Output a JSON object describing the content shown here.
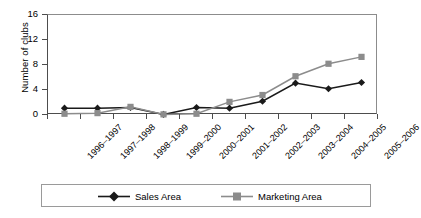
{
  "chart_data": {
    "type": "line",
    "title": "",
    "xlabel": "",
    "ylabel": "Number of clubs",
    "ylim": [
      0,
      16
    ],
    "yticks": [
      0,
      4,
      8,
      12,
      16
    ],
    "grid": false,
    "legend_position": "bottom",
    "categories": [
      "1996–1997",
      "1997–1998",
      "1998–1999",
      "1999–2000",
      "2000–2001",
      "2001–2002",
      "2002–2003",
      "2003–2004",
      "2004–2005",
      "2005–2006"
    ],
    "series": [
      {
        "name": "Sales Area",
        "color": "#1a1a1a",
        "marker": "diamond",
        "values": [
          1.1,
          1.1,
          1.2,
          0.1,
          1.2,
          1.1,
          2.2,
          5.1,
          4.2,
          5.2
        ]
      },
      {
        "name": "Marketing Area",
        "color": "#8c8c8c",
        "marker": "square",
        "values": [
          0.2,
          0.3,
          1.3,
          0.1,
          0.2,
          2.1,
          3.2,
          6.2,
          8.2,
          9.3
        ]
      }
    ]
  },
  "axes": {
    "y_title": "Number of clubs"
  },
  "legend": {
    "items": [
      {
        "label": "Sales Area"
      },
      {
        "label": "Marketing Area"
      }
    ]
  }
}
